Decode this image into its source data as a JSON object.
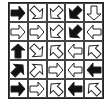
{
  "puzzle": {
    "rows": 5,
    "cols": 5,
    "colors": {
      "black": "#111111",
      "white": "#ffffff",
      "stroke": "#222222",
      "grid": "#444444"
    },
    "cells": [
      [
        {
          "dir": "right",
          "fill": "black"
        },
        {
          "dir": "down-right",
          "fill": "white"
        },
        {
          "dir": "down-left",
          "fill": "white"
        },
        {
          "dir": "down-left",
          "fill": "black"
        },
        {
          "dir": "down",
          "fill": "white"
        }
      ],
      [
        {
          "dir": "right",
          "fill": "white"
        },
        {
          "dir": "right",
          "fill": "white"
        },
        {
          "dir": "down-left",
          "fill": "white"
        },
        {
          "dir": "down-left",
          "fill": "black"
        },
        {
          "dir": "left",
          "fill": "white"
        }
      ],
      [
        {
          "dir": "up",
          "fill": "black"
        },
        {
          "dir": "down-right",
          "fill": "white"
        },
        {
          "dir": "up-left",
          "fill": "white"
        },
        {
          "dir": "left",
          "fill": "white"
        },
        {
          "dir": "up-left",
          "fill": "white"
        }
      ],
      [
        {
          "dir": "up-right",
          "fill": "black"
        },
        {
          "dir": "up-right",
          "fill": "white"
        },
        {
          "dir": "right",
          "fill": "white"
        },
        {
          "dir": "left",
          "fill": "white"
        },
        {
          "dir": "left",
          "fill": "black"
        }
      ],
      [
        {
          "dir": "right",
          "fill": "black"
        },
        {
          "dir": "right",
          "fill": "white"
        },
        {
          "dir": "up-left",
          "fill": "white"
        },
        {
          "dir": "left",
          "fill": "black"
        },
        {
          "dir": "up-left",
          "fill": "white"
        }
      ]
    ]
  }
}
